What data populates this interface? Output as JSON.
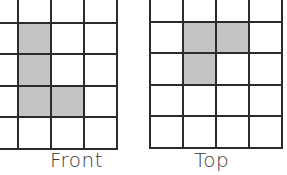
{
  "views": [
    {
      "name": "front",
      "label": "Front",
      "rows": 4,
      "cols": 4,
      "origin": {
        "x": -16,
        "y": -10
      },
      "cell_size": 33,
      "shaded": [
        [
          1,
          1
        ],
        [
          2,
          1
        ],
        [
          3,
          1
        ],
        [
          3,
          2
        ]
      ],
      "label_pos": {
        "x": 50,
        "y": 148
      }
    },
    {
      "name": "top",
      "label": "Top",
      "rows": 4,
      "cols": 4,
      "origin": {
        "x": 149,
        "y": -11
      },
      "cell_size": 33,
      "shaded": [
        [
          1,
          1
        ],
        [
          1,
          2
        ],
        [
          2,
          1
        ]
      ],
      "label_pos": {
        "x": 194,
        "y": 148
      }
    }
  ],
  "colors": {
    "grid_line": "#2b2b2b",
    "shade": "#e6e6e6",
    "text": "#3a3a3a"
  }
}
